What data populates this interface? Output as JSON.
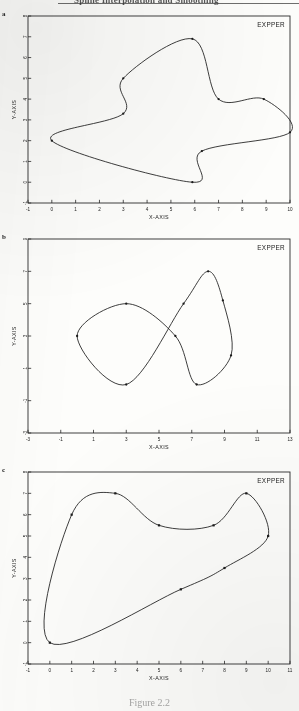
{
  "document": {
    "running_head": "Spline Interpolation and Smoothing",
    "caption": "Figure 2.2"
  },
  "panels": [
    {
      "tag": "a",
      "legend": "EXPPER",
      "chart_index": 0
    },
    {
      "tag": "b",
      "legend": "EXPPER",
      "chart_index": 1
    },
    {
      "tag": "c",
      "legend": "EXPPER",
      "chart_index": 2
    }
  ],
  "chart_data": [
    {
      "type": "line",
      "title": "",
      "subtitle": "",
      "legend_entries": [
        "EXPPER"
      ],
      "legend_position": "top-right",
      "grid": false,
      "xlabel": "X-AXIS",
      "ylabel": "Y-AXIS",
      "xlim": [
        -1,
        10
      ],
      "ylim": [
        -1,
        8
      ],
      "xticks": [
        -1,
        0,
        1,
        2,
        3,
        4,
        5,
        6,
        7,
        8,
        9,
        10
      ],
      "yticks": [
        -1,
        0,
        1,
        2,
        3,
        4,
        5,
        6,
        7,
        8
      ],
      "closed_curve": true,
      "marker": "filled-dot",
      "points": [
        {
          "x": 0.0,
          "y": 2.0
        },
        {
          "x": 3.0,
          "y": 3.3
        },
        {
          "x": 3.0,
          "y": 5.0
        },
        {
          "x": 5.9,
          "y": 6.9
        },
        {
          "x": 7.0,
          "y": 4.0
        },
        {
          "x": 8.9,
          "y": 4.0
        },
        {
          "x": 10.0,
          "y": 2.4
        },
        {
          "x": 6.3,
          "y": 1.5
        },
        {
          "x": 5.9,
          "y": 0.0
        }
      ]
    },
    {
      "type": "line",
      "title": "",
      "subtitle": "",
      "legend_entries": [
        "EXPPER"
      ],
      "legend_position": "top-right",
      "grid": false,
      "xlabel": "X-AXIS",
      "ylabel": "Y-AXIS",
      "xlim": [
        -3,
        13
      ],
      "ylim": [
        -3,
        9
      ],
      "xticks": [
        -3,
        -1,
        1,
        3,
        5,
        7,
        9,
        11,
        13
      ],
      "yticks": [
        -3,
        -1,
        1,
        3,
        5,
        7,
        9
      ],
      "closed_curve": true,
      "self_intersecting": true,
      "marker": "filled-dot",
      "points": [
        {
          "x": 0.0,
          "y": 3.0
        },
        {
          "x": 3.0,
          "y": 5.0
        },
        {
          "x": 6.0,
          "y": 3.0
        },
        {
          "x": 7.3,
          "y": 0.0
        },
        {
          "x": 9.4,
          "y": 1.8
        },
        {
          "x": 8.9,
          "y": 5.2
        },
        {
          "x": 8.0,
          "y": 7.0
        },
        {
          "x": 6.5,
          "y": 5.0
        },
        {
          "x": 3.0,
          "y": 0.0
        }
      ]
    },
    {
      "type": "line",
      "title": "",
      "subtitle": "",
      "legend_entries": [
        "EXPPER"
      ],
      "legend_position": "top-right",
      "grid": false,
      "xlabel": "X-AXIS",
      "ylabel": "Y-AXIS",
      "xlim": [
        -1,
        11
      ],
      "ylim": [
        -1,
        8
      ],
      "xticks": [
        -1,
        0,
        1,
        2,
        3,
        4,
        5,
        6,
        7,
        8,
        9,
        10,
        11
      ],
      "yticks": [
        -1,
        0,
        1,
        2,
        3,
        4,
        5,
        6,
        7,
        8
      ],
      "closed_curve": true,
      "self_intersecting": true,
      "marker": "filled-square",
      "points": [
        {
          "x": 0.0,
          "y": 0.0
        },
        {
          "x": 1.0,
          "y": 6.0
        },
        {
          "x": 3.0,
          "y": 7.0
        },
        {
          "x": 5.0,
          "y": 5.5
        },
        {
          "x": 7.5,
          "y": 5.5
        },
        {
          "x": 9.0,
          "y": 7.0
        },
        {
          "x": 10.0,
          "y": 5.0
        },
        {
          "x": 8.0,
          "y": 3.5
        },
        {
          "x": 6.0,
          "y": 2.5
        }
      ]
    }
  ],
  "style": {
    "ink": "#1b1b1b",
    "paper": "#fdfdfb",
    "axis": "#2a2a2a"
  }
}
